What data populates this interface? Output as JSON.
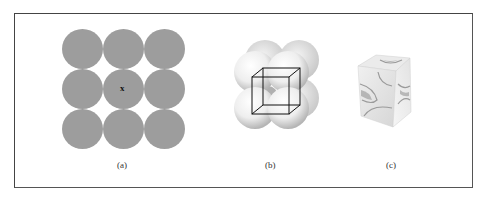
{
  "figure": {
    "panels": [
      {
        "id": "a",
        "label": "(a)",
        "description": "3x3 square array of circles (2D packing)",
        "center_mark": "x"
      },
      {
        "id": "b",
        "label": "(b)",
        "description": "Spheres packed with cubic unit cell wireframe"
      },
      {
        "id": "c",
        "label": "(c)",
        "description": "Unit cube cut from sphere packing"
      }
    ],
    "colors": {
      "circle_fill": "#9d9d9d",
      "border": "#444444",
      "sphere_light": "#f2f2f2",
      "sphere_shadow": "#b8b8b8"
    }
  }
}
